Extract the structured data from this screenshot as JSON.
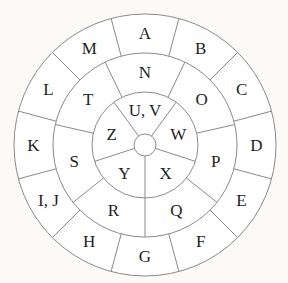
{
  "geometry": {
    "cx": 145,
    "cy": 145,
    "r_outer": 131,
    "r_middle": 92,
    "r_inner": 53,
    "r_hub": 11
  },
  "rings": {
    "outer": {
      "offset_deg": 15,
      "labels": [
        "A",
        "B",
        "C",
        "D",
        "E",
        "F",
        "G",
        "H",
        "I, J",
        "K",
        "L",
        "M"
      ]
    },
    "middle": {
      "offset_deg": 25.714,
      "labels": [
        "N",
        "O",
        "P",
        "Q",
        "R",
        "S",
        "T"
      ]
    },
    "inner": {
      "offset_deg": 36,
      "labels": [
        "U, V",
        "W",
        "X",
        "Y",
        "Z"
      ]
    }
  },
  "colors": {
    "line": "#8a8a8a",
    "text": "#1e1e1e",
    "background": "#fbfaf6",
    "fill": "#ffffff"
  }
}
